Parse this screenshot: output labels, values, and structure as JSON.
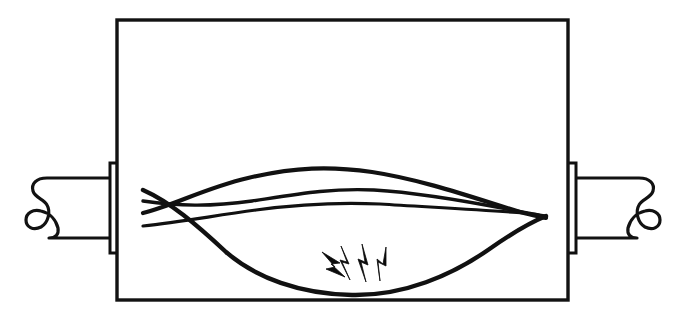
{
  "figure": {
    "title": "Arcing fault inside cable enclosure",
    "canvas": {
      "width": 687,
      "height": 320
    },
    "style": {
      "ink_color": "#111111",
      "paper_color": "#ffffff",
      "line_art": "monochrome technical line drawing"
    }
  },
  "enclosure": {
    "name": "enclosure-box",
    "shape": "rectangle",
    "stroke_width": 3.4,
    "bounds": {
      "x": 117,
      "y": 20,
      "width": 451,
      "height": 280
    }
  },
  "cable_entries": [
    {
      "side": "left",
      "sheath_label": "outer cable sheath",
      "break_symbol": "curl-break",
      "gland_label": "cable gland",
      "segments": 6
    },
    {
      "side": "right",
      "sheath_label": "outer cable sheath",
      "break_symbol": "curl-break",
      "gland_label": "cable gland",
      "segments": 6
    }
  ],
  "conductors": [
    {
      "id": "conductor-1",
      "path_label": "upper bowed conductor",
      "stroke_width": 4.2
    },
    {
      "id": "conductor-2",
      "path_label": "second bowed conductor",
      "stroke_width": 3.4
    },
    {
      "id": "conductor-3",
      "path_label": "third near-straight conductor",
      "stroke_width": 3.2
    },
    {
      "id": "conductor-4",
      "path_label": "lower sagging conductor",
      "stroke_width": 4.4
    }
  ],
  "fault_indicator": {
    "name": "arc-spark",
    "symbol": "lightning-bolts",
    "bolt_count": 4,
    "location_label": "lowest point of sagging conductor",
    "position": {
      "x": 355,
      "y": 292
    }
  }
}
